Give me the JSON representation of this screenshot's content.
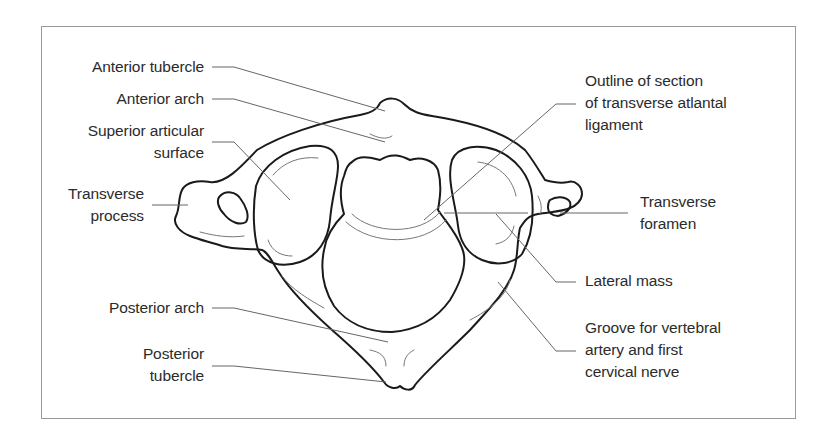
{
  "figure": {
    "labels_left": [
      {
        "id": "anterior-tubercle",
        "lines": [
          "Anterior tubercle"
        ]
      },
      {
        "id": "anterior-arch",
        "lines": [
          "Anterior arch"
        ]
      },
      {
        "id": "superior-articular-surface",
        "lines": [
          "Superior articular",
          "surface"
        ]
      },
      {
        "id": "transverse-process",
        "lines": [
          "Transverse",
          "process"
        ]
      },
      {
        "id": "posterior-arch",
        "lines": [
          "Posterior arch"
        ]
      },
      {
        "id": "posterior-tubercle",
        "lines": [
          "Posterior",
          "tubercle"
        ]
      }
    ],
    "labels_right": [
      {
        "id": "transverse-atlantal-ligament",
        "lines": [
          "Outline of section",
          "of transverse atlantal",
          "ligament"
        ]
      },
      {
        "id": "transverse-foramen",
        "lines": [
          "Transverse",
          "foramen"
        ]
      },
      {
        "id": "lateral-mass",
        "lines": [
          "Lateral mass"
        ]
      },
      {
        "id": "groove-vertebral-artery",
        "lines": [
          "Groove for vertebral",
          "artery and first",
          "cervical nerve"
        ]
      }
    ],
    "colors": {
      "outline": "#1a1a1a",
      "detail": "#777777",
      "leader": "#666666",
      "text": "#2b2b2b",
      "frame": "#9a9a9a"
    }
  }
}
